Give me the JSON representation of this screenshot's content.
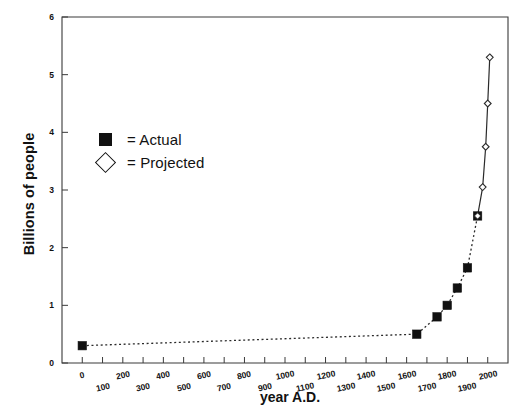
{
  "chart_data": {
    "type": "line",
    "title": "",
    "xlabel": "year A.D.",
    "ylabel": "Billions of people",
    "xlim": [
      -100,
      2100
    ],
    "ylim": [
      0,
      6
    ],
    "grid": false,
    "legend_position": "upper-left-inside",
    "xticks": [
      0,
      100,
      200,
      300,
      400,
      500,
      600,
      700,
      800,
      900,
      1000,
      1100,
      1200,
      1300,
      1400,
      1500,
      1600,
      1700,
      1800,
      1900,
      2000
    ],
    "xtick_labels": [
      "0",
      "100",
      "200",
      "300",
      "400",
      "500",
      "600",
      "700",
      "800",
      "900",
      "1000",
      "1100",
      "1200",
      "1300",
      "1400",
      "1500",
      "1600",
      "1700",
      "1800",
      "1900",
      "2000"
    ],
    "yticks": [
      0,
      1,
      2,
      3,
      4,
      5,
      6
    ],
    "ytick_labels": [
      "0",
      "1",
      "2",
      "3",
      "4",
      "5",
      "6"
    ],
    "series": [
      {
        "name": "Actual",
        "marker": "filled-square",
        "linestyle": "dotted",
        "points": [
          {
            "x": 0,
            "y": 0.3
          },
          {
            "x": 1650,
            "y": 0.5
          },
          {
            "x": 1750,
            "y": 0.8
          },
          {
            "x": 1800,
            "y": 1.0
          },
          {
            "x": 1850,
            "y": 1.3
          },
          {
            "x": 1900,
            "y": 1.65
          },
          {
            "x": 1950,
            "y": 2.55
          }
        ]
      },
      {
        "name": "Projected",
        "marker": "open-diamond",
        "linestyle": "solid",
        "points": [
          {
            "x": 1950,
            "y": 2.55
          },
          {
            "x": 1975,
            "y": 3.05
          },
          {
            "x": 1990,
            "y": 3.75
          },
          {
            "x": 2000,
            "y": 4.5
          },
          {
            "x": 2010,
            "y": 5.3
          }
        ]
      }
    ]
  },
  "legend": {
    "entries": [
      {
        "symbol": "filled-square",
        "label": "= Actual"
      },
      {
        "symbol": "open-diamond",
        "label": "= Projected"
      }
    ]
  }
}
